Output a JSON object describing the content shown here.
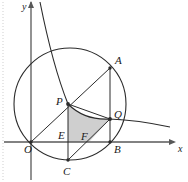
{
  "figure": {
    "type": "geometry-diagram",
    "background_color": "#ffffff",
    "stroke_color": "#2b2b2b",
    "shaded_region_fill": "#cfcfcf",
    "axis_color": "#555555",
    "margin_artifact_color": "#c8c8c8"
  },
  "axes": {
    "x_axis_label": "x",
    "y_axis_label": "y",
    "origin_label": "O",
    "x_axis_y_px": 142,
    "y_axis_x_px": 31,
    "x_axis_arrow_tip_px": 176,
    "y_axis_top_px": 2
  },
  "labels": {
    "O": "O",
    "A": "A",
    "B": "B",
    "C": "C",
    "P": "P",
    "Q": "Q",
    "E": "E",
    "F": "F",
    "x": "x",
    "y": "y"
  },
  "points": {
    "O": {
      "x": 31,
      "y": 142,
      "label": "O",
      "label_x": 24,
      "label_y": 153
    },
    "A": {
      "x": 110,
      "y": 68,
      "label": "A",
      "label_x": 115,
      "label_y": 64
    },
    "B": {
      "x": 110,
      "y": 142,
      "label": "B",
      "label_x": 114,
      "label_y": 153
    },
    "C": {
      "x": 68,
      "y": 160,
      "label": "C",
      "label_x": 64,
      "label_y": 173
    },
    "P": {
      "x": 68,
      "y": 104,
      "label": "P",
      "label_x": 57,
      "label_y": 104
    },
    "Q": {
      "x": 110,
      "y": 119,
      "label": "Q",
      "label_x": 114,
      "label_y": 117
    },
    "E": {
      "x": 68,
      "y": 142,
      "label": "E",
      "label_x": 59,
      "label_y": 138
    },
    "F": {
      "x": 89,
      "y": 142,
      "label": "F",
      "label_x": 81,
      "label_y": 139
    }
  },
  "circle": {
    "center_x": 70,
    "center_y": 104,
    "radius": 56
  },
  "hyperbola": {
    "description": "decreasing branch passing through P and Q",
    "path": "M 40,2 C 48,42 56,74 68,104 C 80,116 94,120 110,119 C 134,120 156,124 170,127"
  },
  "segments": [
    {
      "name": "OA",
      "from": "O",
      "to": "A"
    },
    {
      "name": "PC",
      "from": "P",
      "to": "C"
    },
    {
      "name": "AB",
      "from": "A",
      "to": "B"
    },
    {
      "name": "PE",
      "from": "P",
      "to": "E"
    },
    {
      "name": "PQ-chord",
      "from": "P",
      "to": "Q"
    },
    {
      "name": "CQ",
      "from": "C",
      "to": "Q"
    },
    {
      "name": "QB",
      "from": "Q",
      "to": "B"
    }
  ],
  "shaded_region": {
    "name": "curvilinear-region-PEFQ",
    "vertices": [
      "P",
      "E",
      "F",
      "Q"
    ],
    "fill": "#cfcfcf"
  }
}
